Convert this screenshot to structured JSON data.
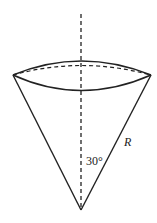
{
  "diagram": {
    "type": "cone-geometry",
    "labels": {
      "slant": "R",
      "angle": "30°"
    },
    "colors": {
      "stroke": "#222222",
      "background": "#ffffff"
    }
  }
}
